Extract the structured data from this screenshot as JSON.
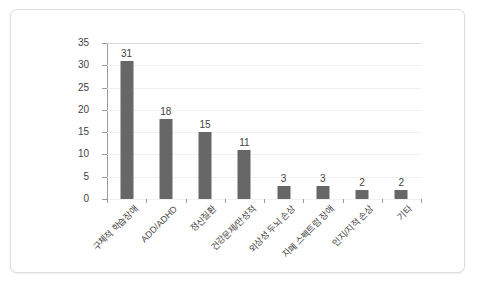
{
  "chart_data": {
    "type": "bar",
    "title": "",
    "subtitle": "",
    "xlabel": "",
    "ylabel": "",
    "ylim": [
      0,
      35
    ],
    "y_ticks": [
      0,
      5,
      10,
      15,
      20,
      25,
      30,
      35
    ],
    "grid": true,
    "legend": false,
    "legend_position": "none",
    "bar_color": "#676767",
    "categories": [
      "구체적 학습장애",
      "ADD/ADHD",
      "정신질환",
      "건강문제/만성적",
      "외상성 두뇌 손상",
      "자폐 스펙트럼 장애",
      "인지/지적 손상",
      "기타"
    ],
    "values": [
      31,
      18,
      15,
      11,
      3,
      3,
      2,
      2
    ],
    "data_labels": [
      "31",
      "18",
      "15",
      "11",
      "3",
      "3",
      "2",
      "2"
    ]
  },
  "axis": {
    "y_tick_labels": [
      "0",
      "5",
      "10",
      "15",
      "20",
      "25",
      "30",
      "35"
    ]
  },
  "colors": {
    "bar": "#676767",
    "grid": "#f0f0f0",
    "axis": "#9a9a9a",
    "frame": "#dcdcdc",
    "text": "#3f3f3f"
  }
}
